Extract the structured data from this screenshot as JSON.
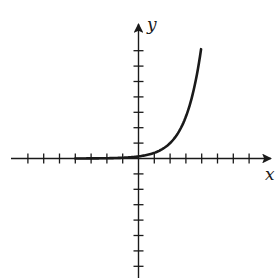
{
  "chart_data": {
    "type": "line",
    "title": "",
    "xlabel": "x",
    "ylabel": "y",
    "function": "y = e^(x - 2)",
    "grid": false,
    "legend": null,
    "xlim": [
      -8,
      8.5
    ],
    "ylim": [
      -7.6,
      8.8
    ],
    "x_ticks": [
      -7,
      -6,
      -5,
      -4,
      -3,
      -2,
      -1,
      1,
      2,
      3,
      4,
      5,
      6,
      7
    ],
    "y_ticks": [
      -7,
      -6,
      -5,
      -4,
      -3,
      -2,
      -1,
      1,
      2,
      3,
      4,
      5,
      6,
      7
    ],
    "tick_labels_shown": false,
    "series": [
      {
        "name": "curve",
        "x": [
          -4,
          -3,
          -2,
          -1,
          0,
          1,
          1.5,
          2,
          2.5,
          3,
          3.5,
          3.96
        ],
        "y": [
          0.0025,
          0.0067,
          0.018,
          0.05,
          0.135,
          0.37,
          0.61,
          1.0,
          1.65,
          2.72,
          4.48,
          7.1
        ]
      }
    ]
  },
  "labels": {
    "x_axis": "x",
    "y_axis": "y"
  },
  "colors": {
    "ink": "#1a1a1a",
    "background": "#ffffff"
  }
}
